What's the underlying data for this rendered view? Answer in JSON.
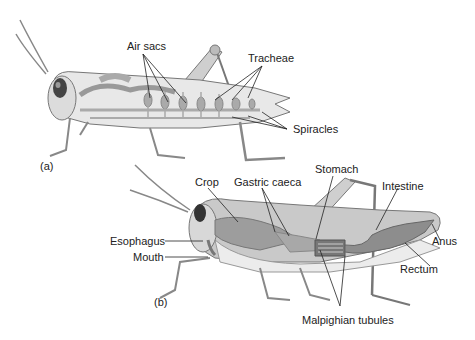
{
  "figure": {
    "panels": [
      {
        "id": "a",
        "panel_label": "(a)",
        "system": "respiratory",
        "labels": [
          "Air sacs",
          "Tracheae",
          "Spiracles"
        ]
      },
      {
        "id": "b",
        "panel_label": "(b)",
        "system": "digestive",
        "labels": [
          "Crop",
          "Gastric caeca",
          "Stomach",
          "Intestine",
          "Esophagus",
          "Mouth",
          "Anus",
          "Rectum",
          "Malpighian tubules"
        ]
      }
    ]
  },
  "labels": {
    "air_sacs": "Air sacs",
    "tracheae": "Tracheae",
    "spiracles": "Spiracles",
    "panel_a": "(a)",
    "crop": "Crop",
    "gastric_caeca": "Gastric caeca",
    "stomach": "Stomach",
    "intestine": "Intestine",
    "esophagus": "Esophagus",
    "mouth": "Mouth",
    "anus": "Anus",
    "rectum": "Rectum",
    "malpighian_tubules": "Malpighian tubules",
    "panel_b": "(b)"
  },
  "colors": {
    "background": "#ffffff",
    "body_fill": "#d9d9d9",
    "organ_fill": "#9a9a9a",
    "outline": "#6f6f6f",
    "leader": "#222222"
  }
}
